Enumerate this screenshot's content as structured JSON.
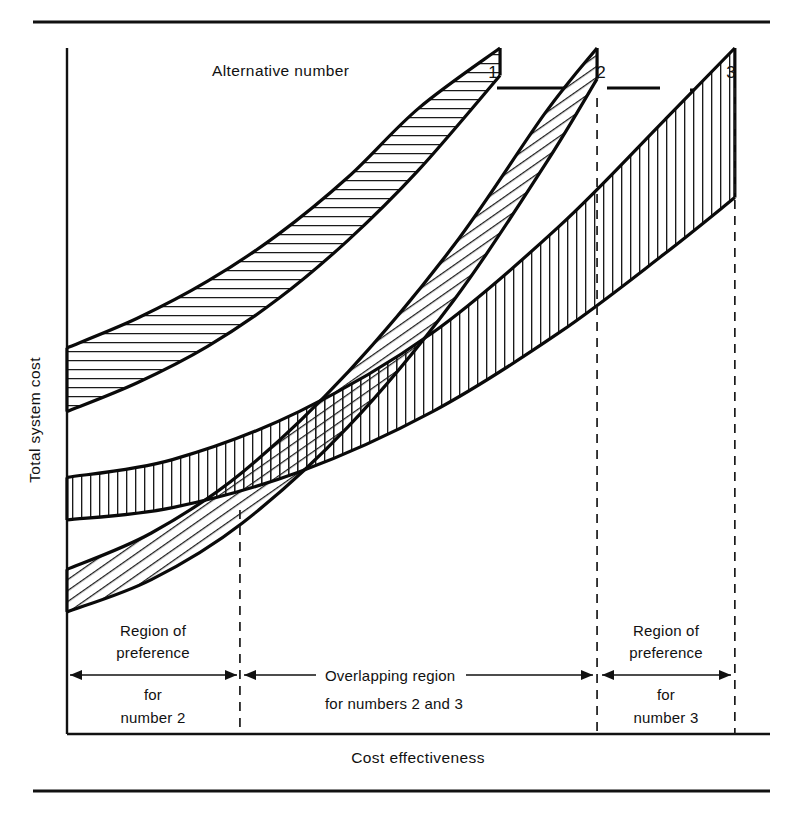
{
  "figure": {
    "kind": "line-band-chart",
    "background_color": "#ffffff",
    "ink_color": "#111111"
  },
  "axes": {
    "ylabel": "Total system cost",
    "xlabel": "Cost effectiveness",
    "x_origin": 67,
    "x_end": 770,
    "y_top": 48,
    "y_bottom": 734
  },
  "legend": {
    "caption": "Alternative number",
    "numbers": [
      "1",
      "2",
      "3"
    ]
  },
  "annotations": {
    "left": {
      "line1": "Region of",
      "line2": "preference",
      "line3": "for",
      "line4": "number 2"
    },
    "middle": {
      "line1": "Overlapping region",
      "line2": "for numbers 2 and 3"
    },
    "right": {
      "line1": "Region of",
      "line2": "preference",
      "line3": "for",
      "line4": "number 3"
    }
  },
  "chart_data": {
    "type": "area",
    "title": "",
    "subtitle": "",
    "xlabel": "Cost effectiveness",
    "ylabel": "Total system cost",
    "xlim": [
      0,
      1
    ],
    "ylim": [
      0,
      1
    ],
    "grid": false,
    "legend_position": "top",
    "legend_title": "Alternative number",
    "axis_ticks": "none",
    "series": [
      {
        "name": "1",
        "label": "Alternative number 1",
        "hatch": "horizontal",
        "x_start": 0.0,
        "x_end": 0.616,
        "lower_bound": [
          {
            "x": 0.0,
            "y": 0.47
          },
          {
            "x": 0.1,
            "y": 0.512
          },
          {
            "x": 0.2,
            "y": 0.565
          },
          {
            "x": 0.3,
            "y": 0.634
          },
          {
            "x": 0.4,
            "y": 0.72
          },
          {
            "x": 0.5,
            "y": 0.822
          },
          {
            "x": 0.616,
            "y": 0.96
          }
        ],
        "upper_bound": [
          {
            "x": 0.0,
            "y": 0.563
          },
          {
            "x": 0.1,
            "y": 0.606
          },
          {
            "x": 0.2,
            "y": 0.66
          },
          {
            "x": 0.3,
            "y": 0.728
          },
          {
            "x": 0.4,
            "y": 0.812
          },
          {
            "x": 0.5,
            "y": 0.912
          },
          {
            "x": 0.616,
            "y": 1.0
          }
        ]
      },
      {
        "name": "2",
        "label": "Alternative number 2",
        "hatch": "diagonal",
        "x_start": 0.0,
        "x_end": 0.754,
        "lower_bound": [
          {
            "x": 0.0,
            "y": 0.178
          },
          {
            "x": 0.12,
            "y": 0.225
          },
          {
            "x": 0.25,
            "y": 0.308
          },
          {
            "x": 0.4,
            "y": 0.448
          },
          {
            "x": 0.55,
            "y": 0.632
          },
          {
            "x": 0.68,
            "y": 0.83
          },
          {
            "x": 0.754,
            "y": 0.955
          }
        ],
        "upper_bound": [
          {
            "x": 0.0,
            "y": 0.24
          },
          {
            "x": 0.12,
            "y": 0.293
          },
          {
            "x": 0.25,
            "y": 0.382
          },
          {
            "x": 0.4,
            "y": 0.528
          },
          {
            "x": 0.55,
            "y": 0.712
          },
          {
            "x": 0.68,
            "y": 0.905
          },
          {
            "x": 0.754,
            "y": 1.0
          }
        ]
      },
      {
        "name": "3",
        "label": "Alternative number 3",
        "hatch": "vertical",
        "x_start": 0.0,
        "x_end": 0.95,
        "lower_bound": [
          {
            "x": 0.0,
            "y": 0.312
          },
          {
            "x": 0.15,
            "y": 0.33
          },
          {
            "x": 0.33,
            "y": 0.382
          },
          {
            "x": 0.52,
            "y": 0.47
          },
          {
            "x": 0.7,
            "y": 0.585
          },
          {
            "x": 0.85,
            "y": 0.7
          },
          {
            "x": 0.95,
            "y": 0.782
          }
        ],
        "upper_bound": [
          {
            "x": 0.0,
            "y": 0.374
          },
          {
            "x": 0.15,
            "y": 0.4
          },
          {
            "x": 0.33,
            "y": 0.47
          },
          {
            "x": 0.52,
            "y": 0.585
          },
          {
            "x": 0.7,
            "y": 0.74
          },
          {
            "x": 0.85,
            "y": 0.895
          },
          {
            "x": 0.95,
            "y": 1.0
          }
        ]
      }
    ],
    "boundaries": [
      {
        "name": "boundary-1",
        "x": 0.246,
        "style": "dashed"
      },
      {
        "name": "boundary-2",
        "x": 0.754,
        "style": "dashed"
      },
      {
        "name": "boundary-3",
        "x": 0.95,
        "style": "dashed"
      }
    ],
    "regions": [
      {
        "name": "region-preference-2",
        "x_range": [
          0.0,
          0.246
        ],
        "label": "Region of preference for number 2"
      },
      {
        "name": "region-overlap",
        "x_range": [
          0.246,
          0.754
        ],
        "label": "Overlapping region for numbers 2 and 3"
      },
      {
        "name": "region-preference-3",
        "x_range": [
          0.754,
          0.95
        ],
        "label": "Region of preference for number 3"
      }
    ]
  }
}
